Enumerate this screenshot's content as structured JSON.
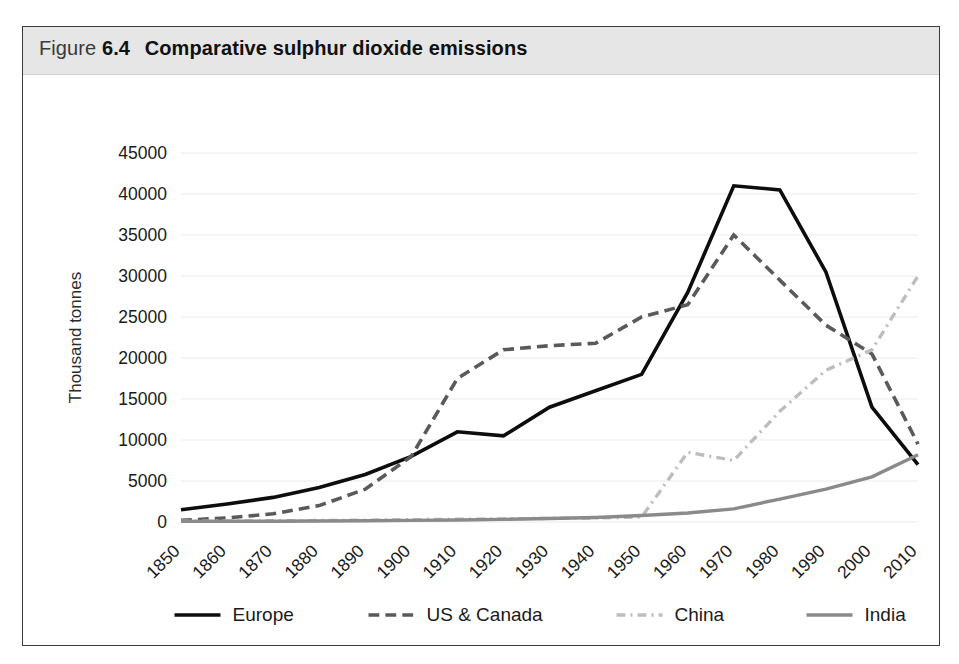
{
  "figure": {
    "label": "Figure",
    "number": "6.4",
    "caption": "Comparative sulphur dioxide emissions",
    "frame_color": "#3b3b3b",
    "header_bg": "#e6e6e6"
  },
  "chart_data": {
    "type": "line",
    "title": "Comparative sulphur dioxide emissions",
    "xlabel": "",
    "ylabel": "Thousand tonnes",
    "x": [
      1850,
      1860,
      1870,
      1880,
      1890,
      1900,
      1910,
      1920,
      1930,
      1940,
      1950,
      1960,
      1970,
      1980,
      1990,
      2000,
      2010
    ],
    "categories": [
      "1850",
      "1860",
      "1870",
      "1880",
      "1890",
      "1900",
      "1910",
      "1920",
      "1930",
      "1940",
      "1950",
      "1960",
      "1970",
      "1980",
      "1990",
      "2000",
      "2010"
    ],
    "xlim": [
      1850,
      2010
    ],
    "ylim": [
      0,
      45000
    ],
    "yticks": [
      0,
      5000,
      10000,
      15000,
      20000,
      25000,
      30000,
      35000,
      40000,
      45000
    ],
    "ytick_labels": [
      "0",
      "5000",
      "10000",
      "15000",
      "20000",
      "25000",
      "30000",
      "35000",
      "40000",
      "45000"
    ],
    "grid": true,
    "legend_position": "bottom",
    "series": [
      {
        "name": "Europe",
        "color": "#0d0d0d",
        "style": "solid",
        "width": 3.6,
        "values": [
          1500,
          2200,
          3000,
          4200,
          5800,
          8000,
          11000,
          10500,
          14000,
          16000,
          18000,
          28000,
          41000,
          40500,
          30500,
          14000,
          7000
        ]
      },
      {
        "name": "US & Canada",
        "color": "#5a5a5a",
        "style": "dashed",
        "width": 3.6,
        "values": [
          200,
          500,
          1000,
          2000,
          4000,
          8000,
          17500,
          21000,
          21500,
          21800,
          25000,
          26500,
          35000,
          29500,
          24000,
          20500,
          9500
        ]
      },
      {
        "name": "China",
        "color": "#bdbdbd",
        "style": "dashdot",
        "width": 3.4,
        "values": [
          100,
          120,
          150,
          180,
          220,
          280,
          330,
          380,
          450,
          500,
          600,
          8500,
          7500,
          13500,
          18500,
          21000,
          30000
        ]
      },
      {
        "name": "India",
        "color": "#8a8a8a",
        "style": "solid",
        "width": 3.4,
        "values": [
          80,
          90,
          100,
          120,
          150,
          200,
          250,
          320,
          420,
          550,
          800,
          1100,
          1600,
          2800,
          4000,
          5500,
          8200
        ]
      }
    ]
  },
  "legend": {
    "items": [
      {
        "label": "Europe"
      },
      {
        "label": "US & Canada"
      },
      {
        "label": "China"
      },
      {
        "label": "India"
      }
    ]
  }
}
